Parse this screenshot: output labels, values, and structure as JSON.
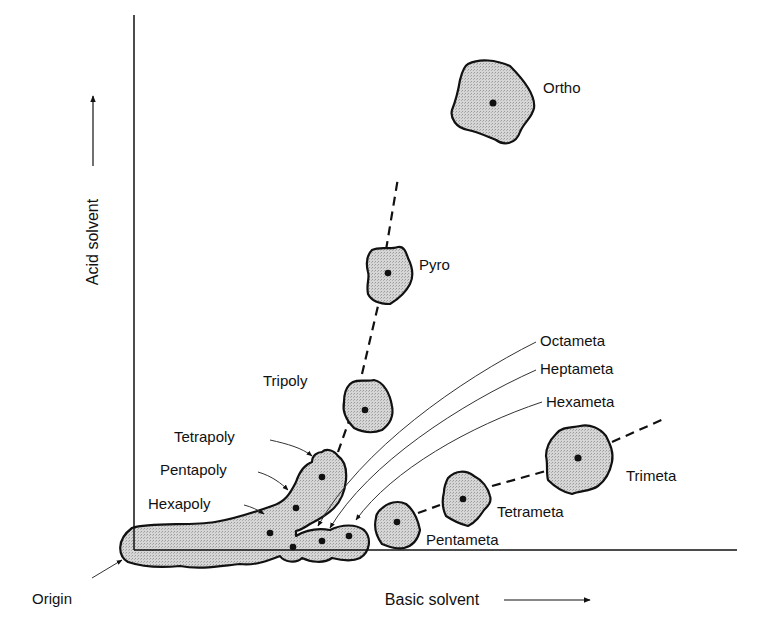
{
  "diagram": {
    "type": "two-dimensional paper chromatogram of condensed phosphates",
    "axes": {
      "y_label": "Acid solvent",
      "x_label": "Basic solvent"
    },
    "origin_label": "Origin",
    "spots": {
      "ortho": "Ortho",
      "pyro": "Pyro",
      "tripoly": "Tripoly",
      "tetrapoly": "Tetrapoly",
      "pentapoly": "Pentapoly",
      "hexapoly": "Hexapoly",
      "octameta": "Octameta",
      "heptameta": "Heptameta",
      "hexameta": "Hexameta",
      "pentameta": "Pentameta",
      "tetrameta": "Tetrameta",
      "trimeta": "Trimeta"
    },
    "series": {
      "linear_polyphosphates": [
        "Ortho",
        "Pyro",
        "Tripoly",
        "Tetrapoly",
        "Pentapoly",
        "Hexapoly"
      ],
      "cyclic_metaphosphates": [
        "Trimeta",
        "Tetrameta",
        "Pentameta",
        "Hexameta",
        "Heptameta",
        "Octameta"
      ]
    }
  }
}
